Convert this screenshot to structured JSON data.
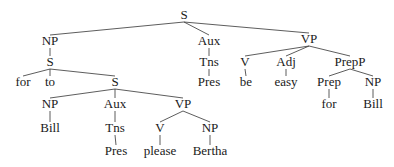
{
  "diagram": {
    "type": "syntax-tree",
    "nodes": [
      {
        "id": "n0",
        "label": "S",
        "x": 184,
        "y": 19
      },
      {
        "id": "n1",
        "label": "NP",
        "x": 50,
        "y": 45
      },
      {
        "id": "n2",
        "label": "S",
        "x": 50,
        "y": 66
      },
      {
        "id": "n3",
        "label": "for",
        "x": 23,
        "y": 86
      },
      {
        "id": "n4",
        "label": "to",
        "x": 50,
        "y": 86
      },
      {
        "id": "n5",
        "label": "S",
        "x": 115,
        "y": 86
      },
      {
        "id": "n6",
        "label": "NP",
        "x": 50,
        "y": 108
      },
      {
        "id": "n7",
        "label": "Bill",
        "x": 50,
        "y": 132
      },
      {
        "id": "n8",
        "label": "Aux",
        "x": 115,
        "y": 108
      },
      {
        "id": "n9",
        "label": "Tns",
        "x": 115,
        "y": 132
      },
      {
        "id": "n10",
        "label": "Pres",
        "x": 116,
        "y": 155
      },
      {
        "id": "n11",
        "label": "VP",
        "x": 183,
        "y": 108
      },
      {
        "id": "n12",
        "label": "V",
        "x": 160,
        "y": 132
      },
      {
        "id": "n13",
        "label": "please",
        "x": 160,
        "y": 155
      },
      {
        "id": "n14",
        "label": "NP",
        "x": 210,
        "y": 132
      },
      {
        "id": "n15",
        "label": "Bertha",
        "x": 210,
        "y": 155
      },
      {
        "id": "n16",
        "label": "Aux",
        "x": 209,
        "y": 45
      },
      {
        "id": "n17",
        "label": "Tns",
        "x": 209,
        "y": 66
      },
      {
        "id": "n18",
        "label": "Pres",
        "x": 209,
        "y": 86
      },
      {
        "id": "n19",
        "label": "VP",
        "x": 309,
        "y": 43
      },
      {
        "id": "n20",
        "label": "V",
        "x": 245,
        "y": 66
      },
      {
        "id": "n21",
        "label": "be",
        "x": 246,
        "y": 86
      },
      {
        "id": "n22",
        "label": "Adj",
        "x": 286,
        "y": 66
      },
      {
        "id": "n23",
        "label": "easy",
        "x": 286,
        "y": 86
      },
      {
        "id": "n24",
        "label": "PrepP",
        "x": 350,
        "y": 66
      },
      {
        "id": "n25",
        "label": "Prep",
        "x": 329,
        "y": 86
      },
      {
        "id": "n26",
        "label": "for",
        "x": 329,
        "y": 108
      },
      {
        "id": "n27",
        "label": "NP",
        "x": 373,
        "y": 86
      },
      {
        "id": "n28",
        "label": "Bill",
        "x": 373,
        "y": 108
      }
    ],
    "edges": [
      [
        "n0",
        "n1"
      ],
      [
        "n0",
        "n16"
      ],
      [
        "n0",
        "n19"
      ],
      [
        "n1",
        "n2"
      ],
      [
        "n2",
        "n3"
      ],
      [
        "n2",
        "n4"
      ],
      [
        "n2",
        "n5"
      ],
      [
        "n5",
        "n6"
      ],
      [
        "n5",
        "n8"
      ],
      [
        "n5",
        "n11"
      ],
      [
        "n6",
        "n7"
      ],
      [
        "n8",
        "n9"
      ],
      [
        "n9",
        "n10"
      ],
      [
        "n11",
        "n12"
      ],
      [
        "n11",
        "n14"
      ],
      [
        "n12",
        "n13"
      ],
      [
        "n14",
        "n15"
      ],
      [
        "n16",
        "n17"
      ],
      [
        "n17",
        "n18"
      ],
      [
        "n19",
        "n20"
      ],
      [
        "n19",
        "n22"
      ],
      [
        "n19",
        "n24"
      ],
      [
        "n20",
        "n21"
      ],
      [
        "n22",
        "n23"
      ],
      [
        "n24",
        "n25"
      ],
      [
        "n24",
        "n27"
      ],
      [
        "n25",
        "n26"
      ],
      [
        "n27",
        "n28"
      ]
    ]
  }
}
